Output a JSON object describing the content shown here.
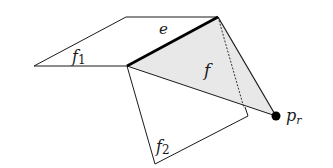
{
  "diagram": {
    "colors": {
      "stroke": "#1a1a1a",
      "shade": "#e6e6e6",
      "background": "#ffffff"
    },
    "faces": [
      {
        "id": "f1",
        "label": "f",
        "subscript": "1",
        "shaded": false
      },
      {
        "id": "f",
        "label": "f",
        "subscript": "",
        "shaded": true
      },
      {
        "id": "f2",
        "label": "f",
        "subscript": "2",
        "shaded": false
      }
    ],
    "edge": {
      "label": "e",
      "bold": true
    },
    "point": {
      "label": "p",
      "subscript": "r"
    },
    "dashed_line": true
  }
}
